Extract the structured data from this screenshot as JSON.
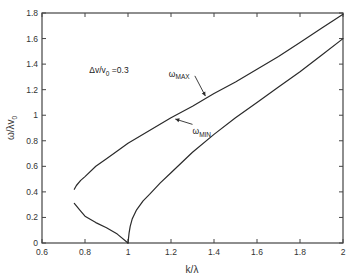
{
  "chart_data": {
    "type": "line",
    "title": "",
    "xlabel": "k/λ",
    "ylabel": "ω/λv₀",
    "xlim": [
      0.6,
      2.0
    ],
    "ylim": [
      0,
      1.8
    ],
    "xticks": [
      0.6,
      0.8,
      1,
      1.2,
      1.4,
      1.6,
      1.8,
      2
    ],
    "xtick_labels": [
      "0.6",
      "0.8",
      "1",
      "1.2",
      "1.4",
      "1.6",
      "1.8",
      "2"
    ],
    "yticks": [
      0,
      0.2,
      0.4,
      0.6,
      0.8,
      1,
      1.2,
      1.4,
      1.6,
      1.8
    ],
    "ytick_labels": [
      "0",
      "0.2",
      "0.4",
      "0.6",
      "0.8",
      "1",
      "1.2",
      "1.4",
      "1.6",
      "1.8"
    ],
    "grid": false,
    "legend": null,
    "annotations": [
      {
        "text": "Δv/v₀ = 0.3",
        "main": "Δv/v",
        "sub": "0",
        "suffix": " =0.3",
        "x": 0.82,
        "y": 1.33
      },
      {
        "text": "ω_MAX",
        "main": "ω",
        "sub": "MAX",
        "x": 1.19,
        "y": 1.3,
        "arrow_to": [
          1.36,
          1.15
        ]
      },
      {
        "text": "ω_MIN",
        "main": "ω",
        "sub": "MIN",
        "x": 1.3,
        "y": 0.85,
        "arrow_to": [
          1.22,
          0.97
        ]
      }
    ],
    "series": [
      {
        "name": "ω_MAX",
        "x": [
          0.75,
          0.76,
          0.78,
          0.8,
          0.85,
          0.9,
          0.95,
          1.0,
          1.1,
          1.2,
          1.3,
          1.4,
          1.5,
          1.6,
          1.7,
          1.8,
          1.9,
          2.0
        ],
        "y": [
          0.42,
          0.45,
          0.49,
          0.52,
          0.6,
          0.66,
          0.72,
          0.78,
          0.88,
          0.98,
          1.07,
          1.17,
          1.26,
          1.36,
          1.46,
          1.57,
          1.68,
          1.79
        ]
      },
      {
        "name": "ω_MIN (k<1 branch)",
        "x": [
          0.75,
          0.78,
          0.8,
          0.85,
          0.9,
          0.95,
          1.0
        ],
        "y": [
          0.31,
          0.25,
          0.21,
          0.16,
          0.12,
          0.07,
          0.0
        ]
      },
      {
        "name": "ω_MIN",
        "x": [
          1.0,
          1.005,
          1.01,
          1.02,
          1.04,
          1.07,
          1.1,
          1.15,
          1.2,
          1.3,
          1.4,
          1.5,
          1.6,
          1.7,
          1.8,
          1.9,
          2.0
        ],
        "y": [
          0.0,
          0.08,
          0.13,
          0.19,
          0.26,
          0.33,
          0.38,
          0.47,
          0.55,
          0.71,
          0.85,
          0.98,
          1.1,
          1.22,
          1.34,
          1.47,
          1.6
        ]
      }
    ]
  },
  "axes": {
    "xlabel": "k/λ",
    "ylabel_main": "ω/λv",
    "ylabel_sub": "0"
  },
  "style": {
    "line_color": "#2a2a2a",
    "axis_color": "#444444",
    "background": "#ffffff"
  }
}
